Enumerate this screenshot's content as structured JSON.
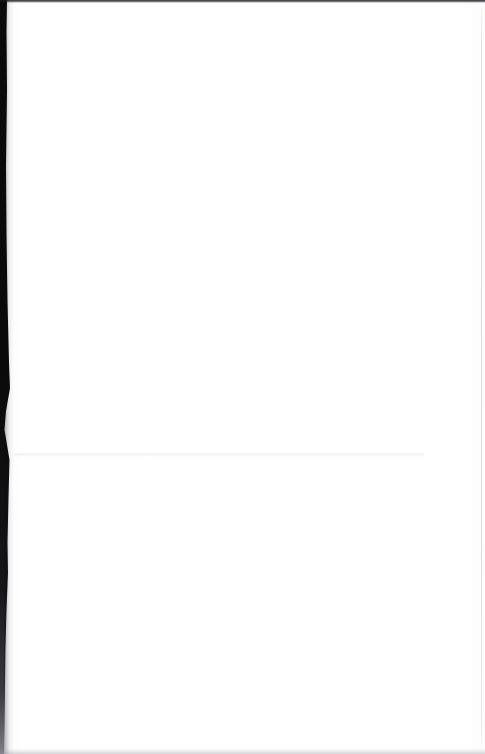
{
  "page": {
    "kind": "scanned-document-page",
    "content_text": "",
    "width_px": 485,
    "height_px": 754,
    "paper_color": "#ffffff",
    "gutter_color": "#0a0a0b",
    "edge_line_color": "#9696a2",
    "top_edge_color": "#1a1a1e",
    "crease_color": "#a0a0ac"
  },
  "artifacts": {
    "left_gutter_label": "left scan gutter",
    "top_edge_label": "top scan edge",
    "right_edge_label": "right page edge",
    "bottom_edge_label": "bottom page edge",
    "crease_label": "horizontal fold crease",
    "noise_label": "paper grain"
  }
}
